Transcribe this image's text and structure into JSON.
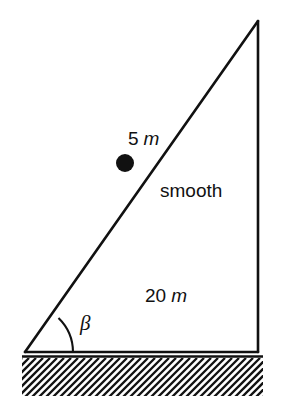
{
  "figure": {
    "name": "inclined-plane-free-body-diagram",
    "background_color": "#ffffff",
    "ink_color": "#111111"
  },
  "labels": {
    "slope_distance": {
      "value": "5",
      "unit": "m",
      "full": "5 m"
    },
    "surface": {
      "text": "smooth"
    },
    "incline_length": {
      "value": "20",
      "unit": "m",
      "full": "20 m"
    },
    "angle": {
      "symbol": "β"
    }
  },
  "geometry": {
    "triangle": {
      "left_vertex": [
        25,
        352
      ],
      "apex": [
        258,
        21
      ],
      "right_vertex": [
        258,
        352
      ],
      "stroke_width": 2.6
    },
    "particle": {
      "center": [
        125,
        163
      ],
      "radius": 9,
      "fill": "#111111"
    },
    "angle_arc": {
      "vertex": [
        25,
        352
      ],
      "radius": 48
    },
    "ground": {
      "top_line_y": 356,
      "band_top": 358,
      "band_bottom": 396,
      "x_start": 22,
      "x_end": 263,
      "hatch_spacing": 7,
      "hatch_direction": "backslash"
    }
  }
}
